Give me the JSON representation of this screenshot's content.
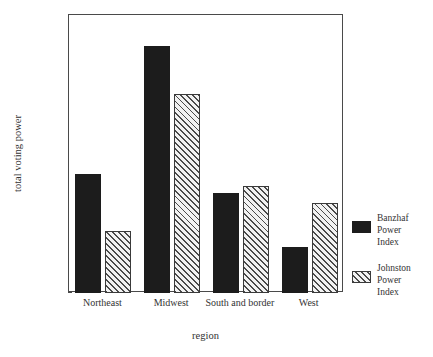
{
  "chart_data": {
    "type": "bar",
    "title": "",
    "xlabel": "region",
    "ylabel": "total voting power",
    "categories": [
      "Northeast",
      "Midwest",
      "South and border",
      "West"
    ],
    "series": [
      {
        "name": "Banzhaf Power Index",
        "style": "solid-black",
        "values": [
          0.237,
          0.32,
          0.225,
          0.19
        ]
      },
      {
        "name": "Johnston Power Index",
        "style": "diagonal-hatch",
        "values": [
          0.2,
          0.289,
          0.229,
          0.218
        ]
      }
    ],
    "ylim": [
      0.16,
      0.34
    ],
    "ytick_step": 0.02,
    "ytick_labels": [
      ".340",
      ".320",
      ".300",
      ".280",
      ".260",
      ".240",
      ".220",
      ".200",
      ".180",
      ".160"
    ],
    "ytick_values": [
      0.34,
      0.32,
      0.3,
      0.28,
      0.26,
      0.24,
      0.22,
      0.2,
      0.18,
      0.16
    ],
    "grid": false,
    "legend_position": "right",
    "colors": {
      "series1": "#1c1c1c",
      "series2_fill": "#f2f2f2",
      "series2_hatch": "#4a4a4a",
      "axis": "#4a4a4a",
      "text": "#333333",
      "background": "#ffffff"
    }
  },
  "legend": {
    "entries": [
      {
        "label_line1": "Banzhaf",
        "label_line2": "Power",
        "label_line3": "Index"
      },
      {
        "label_line1": "Johnston",
        "label_line2": "Power",
        "label_line3": "Index"
      }
    ]
  }
}
